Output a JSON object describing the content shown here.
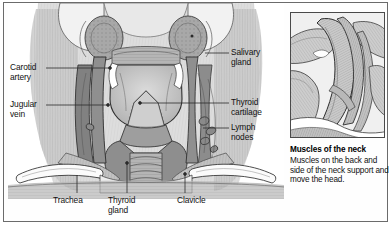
{
  "figure": {
    "border_color": "#6b6b6b",
    "background": "#ffffff"
  },
  "main_illustration": {
    "name": "anterior-neck-dissection",
    "description": "Anterior view dissection of the neck showing larynx, thyroid gland, trachea, great vessels and clavicles",
    "ink_color": "#333333",
    "tissue_fill": "#b9b9b9",
    "bone_fill": "#f4f4f4"
  },
  "labels": {
    "left": [
      {
        "id": "carotid-artery",
        "text": "Carotid\nartery",
        "x": 10,
        "y": 64
      },
      {
        "id": "jugular-vein",
        "text": "Jugular\nvein",
        "x": 10,
        "y": 101
      }
    ],
    "right": [
      {
        "id": "salivary-gland",
        "text": "Salivary\ngland",
        "x": 231,
        "y": 48
      },
      {
        "id": "thyroid-cartilage",
        "text": "Thyroid\ncartilage",
        "x": 231,
        "y": 99
      },
      {
        "id": "lymph-nodes",
        "text": "Lymph\nnodes",
        "x": 231,
        "y": 124
      }
    ],
    "bottom": [
      {
        "id": "trachea",
        "text": "Trachea",
        "x": 53,
        "y": 197
      },
      {
        "id": "thyroid-gland",
        "text": "Thyroid\ngland",
        "x": 108,
        "y": 197
      },
      {
        "id": "clavicle",
        "text": "Clavicle",
        "x": 177,
        "y": 197
      }
    ]
  },
  "inset": {
    "name": "muscles-of-the-neck-panel",
    "description": "Close-up of striated neck muscles of the back and side of the neck",
    "border_color": "#4a4a4a"
  },
  "caption": {
    "title": "Muscles of the neck",
    "body": "Muscles on the back and side of the neck support and move the head."
  }
}
